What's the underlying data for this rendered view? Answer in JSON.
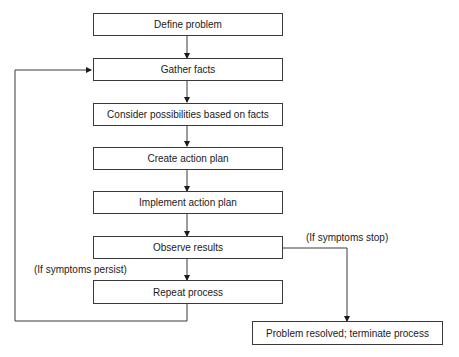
{
  "diagram": {
    "type": "flowchart",
    "nodes": [
      {
        "id": "define",
        "label": "Define problem"
      },
      {
        "id": "gather",
        "label": "Gather facts"
      },
      {
        "id": "consider",
        "label": "Consider possibilities based on facts"
      },
      {
        "id": "create",
        "label": "Create action plan"
      },
      {
        "id": "implement",
        "label": "Implement action plan"
      },
      {
        "id": "observe",
        "label": "Observe results"
      },
      {
        "id": "repeat",
        "label": "Repeat process"
      },
      {
        "id": "resolved",
        "label": "Problem resolved; terminate process"
      }
    ],
    "edge_labels": {
      "persist": "(If symptoms persist)",
      "stop": "(If symptoms stop)"
    },
    "edges": [
      {
        "from": "define",
        "to": "gather"
      },
      {
        "from": "gather",
        "to": "consider"
      },
      {
        "from": "consider",
        "to": "create"
      },
      {
        "from": "create",
        "to": "implement"
      },
      {
        "from": "implement",
        "to": "observe"
      },
      {
        "from": "observe",
        "to": "repeat",
        "label": "(If symptoms persist)"
      },
      {
        "from": "observe",
        "to": "resolved",
        "label": "(If symptoms stop)"
      },
      {
        "from": "repeat",
        "to": "gather"
      }
    ],
    "colors": {
      "line": "#3a3a3a",
      "box_border": "#3a3a3a",
      "background": "#ffffff"
    }
  }
}
